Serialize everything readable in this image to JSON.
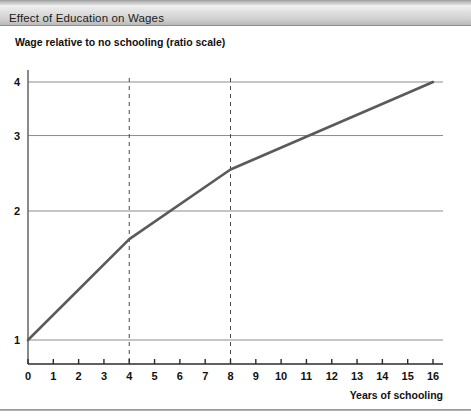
{
  "figure": {
    "title": "Effect of Education on Wages",
    "bottom_rule": true
  },
  "chart_data": {
    "type": "line",
    "title": "Effect of Education on Wages",
    "subtitle": "Wage relative to no schooling (ratio scale)",
    "xlabel": "Years of schooling",
    "ylabel": "Wage relative to no schooling (ratio scale)",
    "yscale": "log",
    "xlim": [
      0,
      16
    ],
    "ylim": [
      1,
      4.3
    ],
    "grid": "horizontal",
    "legend": "none",
    "x_ticks": [
      0,
      1,
      2,
      3,
      4,
      5,
      6,
      7,
      8,
      9,
      10,
      11,
      12,
      13,
      14,
      15,
      16
    ],
    "x_tick_labels": [
      "0",
      "1",
      "2",
      "3",
      "4",
      "5",
      "6",
      "7",
      "8",
      "9",
      "10",
      "11",
      "12",
      "13",
      "14",
      "15",
      "16"
    ],
    "y_ticks": [
      1,
      2,
      3,
      4
    ],
    "y_tick_labels": [
      "1",
      "2",
      "3",
      "4"
    ],
    "series": [
      {
        "name": "Wage ratio",
        "color": "#5a5a5a",
        "x": [
          0,
          4,
          8,
          16
        ],
        "values": [
          1.0,
          1.72,
          2.5,
          4.0
        ]
      }
    ],
    "annotations": [
      {
        "name": "primary-school-marker",
        "type": "vline",
        "x": 4,
        "style": "dashed"
      },
      {
        "name": "secondary-school-marker",
        "type": "vline",
        "x": 8,
        "style": "dashed"
      }
    ]
  }
}
